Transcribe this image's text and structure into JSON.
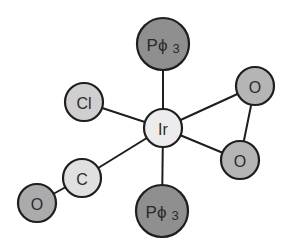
{
  "diagram": {
    "title": "",
    "colors": {
      "bond": "#1e1e1e",
      "outline": "#1e1e1e",
      "light_atom": "#e6e6e6",
      "mid_atom": "#b5b5b5",
      "dark_atom": "#8f8f8f",
      "text": "#2a2a2a"
    },
    "atoms": [
      {
        "id": "pph3_top",
        "label": "Pϕ3",
        "main": "Pϕ",
        "sub": "3"
      },
      {
        "id": "cl",
        "label": "Cl"
      },
      {
        "id": "ir",
        "label": "Ir"
      },
      {
        "id": "o_top_right",
        "label": "O"
      },
      {
        "id": "o_right",
        "label": "O"
      },
      {
        "id": "c",
        "label": "C"
      },
      {
        "id": "o_bottom_left",
        "label": "O"
      },
      {
        "id": "pph3_bottom",
        "label": "Pϕ3",
        "main": "Pϕ",
        "sub": "3"
      }
    ],
    "bonds": [
      [
        "ir",
        "pph3_top"
      ],
      [
        "ir",
        "cl"
      ],
      [
        "ir",
        "o_top_right"
      ],
      [
        "ir",
        "o_right"
      ],
      [
        "o_top_right",
        "o_right"
      ],
      [
        "ir",
        "c"
      ],
      [
        "c",
        "o_bottom_left"
      ],
      [
        "ir",
        "pph3_bottom"
      ]
    ]
  }
}
